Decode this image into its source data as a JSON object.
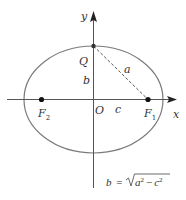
{
  "diagram": {
    "labels": {
      "y_axis": "y",
      "x_axis": "x",
      "point_q": "Q",
      "origin": "O",
      "semi_minor": "b",
      "hypotenuse": "a",
      "focal_distance": "c",
      "focus_left": "F",
      "focus_left_sub": "2",
      "focus_right": "F",
      "focus_right_sub": "1"
    },
    "formula": {
      "lhs": "b",
      "eq": "=",
      "radicand_a": "a",
      "exp_a": "2",
      "minus": "−",
      "radicand_c": "c",
      "exp_c": "2"
    },
    "colors": {
      "stroke": "#555555",
      "text": "#333333",
      "ellipse": "#7a7a7a"
    }
  }
}
